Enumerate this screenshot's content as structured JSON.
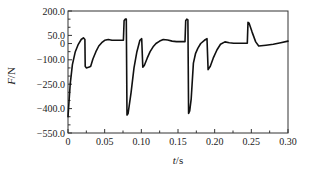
{
  "chart_data": {
    "type": "line",
    "title": "",
    "xlabel": "t/s",
    "ylabel": "F/N",
    "xlabel_var": "t",
    "xlabel_unit": "/s",
    "ylabel_var": "F",
    "ylabel_unit": "/N",
    "xlim": [
      0,
      0.3
    ],
    "ylim": [
      -550,
      200
    ],
    "grid": false,
    "legend": null,
    "x_ticks": [
      0,
      0.05,
      0.1,
      0.15,
      0.2,
      0.25,
      0.3
    ],
    "x_tick_labels": [
      "0",
      "0.05",
      "0.10",
      "0.15",
      "0.20",
      "0.25",
      "0.30"
    ],
    "y_ticks": [
      200,
      50,
      0,
      -100,
      -250,
      -400,
      -550
    ],
    "y_tick_labels": [
      "200.0",
      "50.0",
      "0",
      "-100.0",
      "-250.0",
      "-400.0",
      "-550.0"
    ],
    "line_color": "#111111",
    "series": [
      {
        "name": "F",
        "x": [
          0.0,
          0.003,
          0.006,
          0.01,
          0.014,
          0.018,
          0.021,
          0.023,
          0.0235,
          0.025,
          0.029,
          0.031,
          0.034,
          0.038,
          0.042,
          0.046,
          0.05,
          0.055,
          0.06,
          0.066,
          0.072,
          0.0755,
          0.0765,
          0.078,
          0.0795,
          0.0805,
          0.082,
          0.086,
          0.09,
          0.094,
          0.098,
          0.1005,
          0.102,
          0.104,
          0.108,
          0.112,
          0.116,
          0.12,
          0.125,
          0.13,
          0.136,
          0.142,
          0.148,
          0.155,
          0.1595,
          0.1605,
          0.162,
          0.1635,
          0.1645,
          0.166,
          0.168,
          0.171,
          0.174,
          0.177,
          0.181,
          0.186,
          0.1895,
          0.191,
          0.194,
          0.198,
          0.203,
          0.208,
          0.214,
          0.22,
          0.226,
          0.232,
          0.238,
          0.2445,
          0.2455,
          0.247,
          0.251,
          0.256,
          0.26,
          0.27,
          0.28,
          0.29,
          0.3
        ],
        "y": [
          -450,
          -250,
          -130,
          -50,
          -5,
          25,
          35,
          25,
          -140,
          -150,
          -145,
          -140,
          -95,
          -50,
          -15,
          5,
          20,
          25,
          20,
          20,
          20,
          20,
          140,
          150,
          150,
          -440,
          -430,
          -300,
          -150,
          -50,
          20,
          30,
          -145,
          -135,
          -90,
          -50,
          -20,
          0,
          15,
          25,
          22,
          15,
          12,
          12,
          12,
          140,
          150,
          145,
          -430,
          -415,
          -340,
          -120,
          -60,
          -30,
          0,
          20,
          30,
          -160,
          -140,
          -90,
          -40,
          -5,
          10,
          5,
          2,
          2,
          2,
          2,
          130,
          125,
          70,
          10,
          -15,
          -10,
          -5,
          5,
          15
        ]
      }
    ]
  }
}
